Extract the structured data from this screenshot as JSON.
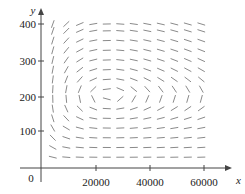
{
  "chart_data": {
    "type": "direction_field",
    "title": "",
    "xlabel": "x",
    "ylabel": "y",
    "origin_label": "0",
    "xlim": [
      0,
      70000
    ],
    "ylim": [
      0,
      430
    ],
    "x_ticks": [
      20000,
      40000,
      60000
    ],
    "x_tick_labels": [
      "20000",
      "40000",
      "60000"
    ],
    "y_ticks": [
      100,
      200,
      300,
      400
    ],
    "y_tick_labels": [
      "100",
      "200",
      "300",
      "400"
    ],
    "grid": false,
    "legend": null,
    "field": {
      "description": "Predator-prey (Lotka-Volterra type) direction field; closed orbits around equilibrium",
      "equations": {
        "dx_dt": "x*(a - b*y)",
        "dy_dt": "y*(-c + d*x)"
      },
      "params": {
        "a": 0.08,
        "b": 0.0004,
        "c": 0.02,
        "d": 8e-07
      },
      "equilibrium": {
        "x": 25000,
        "y": 200
      },
      "sample_x": [
        4000,
        9000,
        14000,
        19000,
        24000,
        29000,
        34000,
        39000,
        44000,
        49000,
        54000,
        59000
      ],
      "sample_y": [
        30,
        57,
        84,
        111,
        138,
        165,
        192,
        219,
        246,
        273,
        300,
        327,
        354,
        381,
        400
      ]
    },
    "colors": {
      "axis": "#444444",
      "segment": "#8a8a8a",
      "text": "#222222"
    }
  }
}
